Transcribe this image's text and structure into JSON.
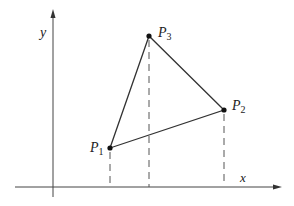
{
  "axes": {
    "x_label": "x",
    "y_label": "y"
  },
  "points": [
    {
      "name": "P",
      "sub": "1",
      "x": 110,
      "y": 148
    },
    {
      "name": "P",
      "sub": "2",
      "x": 224,
      "y": 110
    },
    {
      "name": "P",
      "sub": "3",
      "x": 149,
      "y": 36
    }
  ],
  "colors": {
    "line": "#333333",
    "axis": "#444444",
    "dash": "#555555"
  }
}
